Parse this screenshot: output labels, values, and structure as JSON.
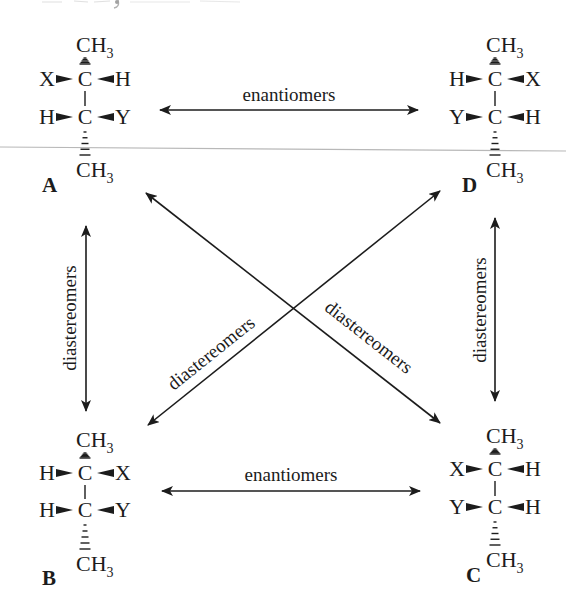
{
  "colors": {
    "ink": "#1c1c1c",
    "scan_line": "#b8b8b8",
    "background": "#ffffff"
  },
  "molecules": [
    {
      "id": "A",
      "label": "A",
      "top": "CH3",
      "bottom": "CH3",
      "row1": {
        "left": "X",
        "right": "H"
      },
      "row2": {
        "left": "H",
        "right": "Y"
      }
    },
    {
      "id": "D",
      "label": "D",
      "top": "CH3",
      "bottom": "CH3",
      "row1": {
        "left": "H",
        "right": "X"
      },
      "row2": {
        "left": "Y",
        "right": "H"
      }
    },
    {
      "id": "B",
      "label": "B",
      "top": "CH3",
      "bottom": "CH3",
      "row1": {
        "left": "H",
        "right": "X"
      },
      "row2": {
        "left": "H",
        "right": "Y"
      }
    },
    {
      "id": "C",
      "label": "C",
      "top": "CH3",
      "bottom": "CH3",
      "row1": {
        "left": "X",
        "right": "H"
      },
      "row2": {
        "left": "Y",
        "right": "H"
      }
    }
  ],
  "atoms": {
    "carbon": "C",
    "methyl_main": "CH",
    "methyl_sub": "3"
  },
  "relationships": [
    {
      "from": "A",
      "to": "D",
      "label": "enantiomers"
    },
    {
      "from": "B",
      "to": "C",
      "label": "enantiomers"
    },
    {
      "from": "A",
      "to": "B",
      "label": "diastereomers"
    },
    {
      "from": "D",
      "to": "C",
      "label": "diastereomers"
    },
    {
      "from": "D",
      "to": "B",
      "label": "diastereomers"
    },
    {
      "from": "A",
      "to": "C",
      "label": "diastereomers"
    }
  ]
}
